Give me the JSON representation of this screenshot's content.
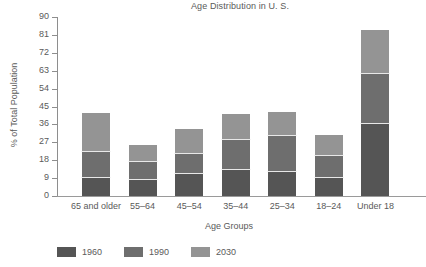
{
  "chart_data": {
    "type": "bar",
    "subtype": "stacked-bar",
    "title": "Age Distribution in U. S.",
    "xlabel": "Age Groups",
    "ylabel": "% of Total Population",
    "categories": [
      "65 and older",
      "55–64",
      "45–54",
      "35–44",
      "25–34",
      "18–24",
      "Under 18"
    ],
    "series": [
      {
        "name": "1960",
        "color": "#555555",
        "values": [
          9,
          8,
          11,
          13,
          12,
          9,
          36
        ]
      },
      {
        "name": "1990",
        "color": "#6e6e6e",
        "values": [
          13,
          9,
          10,
          15,
          18,
          11,
          25.5
        ]
      },
      {
        "name": "2030",
        "color": "#949494",
        "values": [
          20.5,
          9,
          13,
          13.5,
          12.5,
          11,
          22.5
        ]
      }
    ],
    "totals": [
      42.5,
      26,
      34,
      41.5,
      42.5,
      31,
      84
    ],
    "ylim": [
      0,
      90
    ],
    "yticks": [
      0,
      9,
      18,
      27,
      36,
      45,
      54,
      63,
      72,
      81,
      90
    ],
    "ytick_labels": [
      "0",
      "9",
      "18",
      "27",
      "36",
      "45",
      "54",
      "63",
      "72",
      "81",
      "90"
    ],
    "grid": false,
    "legend_position": "bottom-left",
    "legend_entries": [
      "1960",
      "1990",
      "2030"
    ]
  }
}
